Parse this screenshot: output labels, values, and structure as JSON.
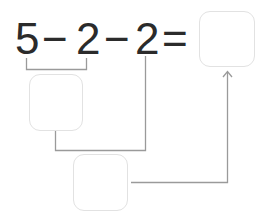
{
  "equation": {
    "tokens": [
      "5",
      "−",
      "2",
      "−",
      "2",
      "="
    ],
    "answer_box": ""
  },
  "step_boxes": [
    {
      "value": ""
    },
    {
      "value": ""
    }
  ],
  "colors": {
    "text": "#2b2b2b",
    "box_border": "#e2e2e2",
    "connector": "#9a9a9a"
  }
}
